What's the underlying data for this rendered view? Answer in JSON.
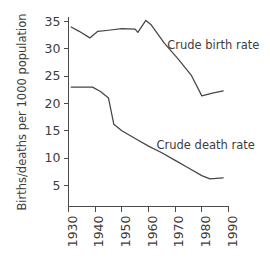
{
  "chart_data": {
    "type": "line",
    "title": "",
    "xlabel": "",
    "ylabel": "Births/deaths per 1000 population",
    "xlim": [
      1930,
      1990
    ],
    "ylim": [
      0,
      36
    ],
    "yticks": [
      5,
      10,
      15,
      20,
      25,
      30,
      35
    ],
    "ytick_labels": [
      "5",
      "10",
      "15",
      "20",
      "25",
      "30",
      "35"
    ],
    "xticks": [
      1930,
      1940,
      1950,
      1960,
      1970,
      1980,
      1990
    ],
    "xtick_labels": [
      "1930",
      "1940",
      "1950",
      "1960",
      "1970",
      "1980",
      "1990"
    ],
    "grid": false,
    "legend_position": "inline-annotation",
    "line_color": "#454545",
    "axis_color": "#4a4a4a",
    "series": [
      {
        "name": "Crude birth rate",
        "label": "Crude birth rate",
        "label_x": 1967,
        "label_y": 30.6,
        "x": [
          1931,
          1934,
          1938,
          1941,
          1945,
          1950,
          1955,
          1956,
          1959,
          1961,
          1966,
          1971,
          1976,
          1980,
          1984,
          1988
        ],
        "values": [
          34.0,
          33.2,
          32.0,
          33.2,
          33.4,
          33.7,
          33.6,
          33.0,
          35.2,
          34.4,
          31.0,
          28.2,
          25.2,
          21.4,
          21.9,
          22.3
        ]
      },
      {
        "name": "Crude death rate",
        "label": "Crude death rate",
        "label_x": 1963,
        "label_y": 12.4,
        "x": [
          1931,
          1936,
          1939,
          1942,
          1945,
          1947,
          1950,
          1955,
          1960,
          1965,
          1970,
          1975,
          1980,
          1983,
          1988
        ],
        "values": [
          23.0,
          23.0,
          23.0,
          22.2,
          21.0,
          16.2,
          15.0,
          13.6,
          12.2,
          11.0,
          9.6,
          8.2,
          6.8,
          6.2,
          6.4
        ]
      }
    ]
  }
}
